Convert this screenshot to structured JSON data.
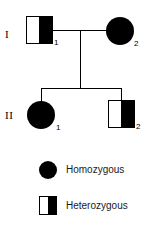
{
  "diagram": {
    "background_color": "#ffffff",
    "symbol_color": "#000000"
  },
  "generations": [
    {
      "label": "I",
      "individuals": [
        {
          "id": "1",
          "sex": "male",
          "symbol": "square",
          "fill": "half",
          "genotype": "Heterozygous"
        },
        {
          "id": "2",
          "sex": "female",
          "symbol": "circle",
          "fill": "full",
          "genotype": "Homozygous"
        }
      ]
    },
    {
      "label": "II",
      "individuals": [
        {
          "id": "1",
          "sex": "female",
          "symbol": "circle",
          "fill": "full",
          "genotype": "Homozygous"
        },
        {
          "id": "2",
          "sex": "male",
          "symbol": "square",
          "fill": "half",
          "genotype": "Heterozygous"
        }
      ]
    }
  ],
  "legend": {
    "items": [
      {
        "symbol": "circle-filled",
        "label": "Homozygous"
      },
      {
        "symbol": "square-half-filled",
        "label": "Heterozygous"
      }
    ]
  }
}
